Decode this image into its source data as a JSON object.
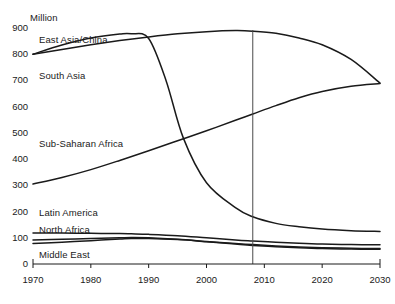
{
  "chart_data": {
    "type": "line",
    "title": "",
    "subtitle": "",
    "xlabel": "",
    "ylabel": "Million",
    "unit_label": "Million",
    "xlim": [
      1970,
      2030
    ],
    "ylim": [
      0,
      900
    ],
    "grid": false,
    "legend_position": "inline-labels",
    "x_ticks": [
      "1970",
      "1980",
      "1990",
      "2000",
      "2010",
      "2020",
      "2030"
    ],
    "y_ticks": [
      "0",
      "100",
      "200",
      "300",
      "400",
      "500",
      "600",
      "700",
      "800",
      "900"
    ],
    "annotations": [
      {
        "name": "reference-year-line",
        "type": "vertical-line",
        "x": 2008
      }
    ],
    "series": [
      {
        "name": "East Asia/China",
        "label": "East Asia/China",
        "color": "#1a1a1a",
        "x": [
          1970,
          1975,
          1980,
          1985,
          1987,
          1990,
          1993,
          1996,
          2000,
          2005,
          2008,
          2012,
          2016,
          2020,
          2025,
          2030
        ],
        "values": [
          800,
          835,
          862,
          877,
          878,
          860,
          700,
          480,
          310,
          215,
          180,
          155,
          142,
          133,
          127,
          124
        ]
      },
      {
        "name": "South Asia",
        "label": "South Asia",
        "color": "#1a1a1a",
        "x": [
          1970,
          1975,
          1980,
          1985,
          1990,
          1995,
          2000,
          2005,
          2008,
          2012,
          2016,
          2020,
          2025,
          2030
        ],
        "values": [
          800,
          818,
          836,
          852,
          866,
          878,
          886,
          890,
          888,
          880,
          862,
          836,
          780,
          690
        ]
      },
      {
        "name": "Sub-Saharan Africa",
        "label": "Sub-Saharan Africa",
        "color": "#1a1a1a",
        "x": [
          1970,
          1975,
          1980,
          1985,
          1990,
          1995,
          2000,
          2005,
          2008,
          2012,
          2016,
          2020,
          2025,
          2030
        ],
        "values": [
          305,
          330,
          360,
          395,
          432,
          470,
          508,
          548,
          572,
          604,
          634,
          658,
          678,
          688
        ]
      },
      {
        "name": "Latin America",
        "label": "Latin America",
        "color": "#1a1a1a",
        "x": [
          1970,
          1975,
          1980,
          1985,
          1987,
          1990,
          1995,
          2000,
          2005,
          2008,
          2012,
          2016,
          2020,
          2025,
          2030
        ],
        "values": [
          118,
          118,
          117,
          116,
          115,
          113,
          108,
          100,
          92,
          88,
          83,
          79,
          76,
          74,
          73
        ]
      },
      {
        "name": "North Africa",
        "label": "North Africa",
        "color": "#1a1a1a",
        "x": [
          1970,
          1975,
          1980,
          1985,
          1987,
          1990,
          1995,
          2000,
          2005,
          2008,
          2012,
          2016,
          2020,
          2025,
          2030
        ],
        "values": [
          92,
          94,
          97,
          100,
          101,
          100,
          94,
          85,
          76,
          71,
          66,
          62,
          59,
          57,
          56
        ]
      },
      {
        "name": "Middle East",
        "label": "Middle East",
        "color": "#1a1a1a",
        "x": [
          1970,
          1975,
          1980,
          1985,
          1987,
          1990,
          1995,
          2000,
          2005,
          2008,
          2012,
          2016,
          2020,
          2025,
          2030
        ],
        "values": [
          78,
          83,
          89,
          95,
          97,
          97,
          93,
          86,
          78,
          74,
          69,
          65,
          62,
          60,
          59
        ]
      }
    ]
  },
  "axis": {
    "unit": "Million"
  },
  "labels": {
    "east_asia": "East Asia/China",
    "south_asia": "South Asia",
    "sub_saharan_africa": "Sub-Saharan Africa",
    "latin_america": "Latin America",
    "north_africa": "North Africa",
    "middle_east": "Middle East"
  }
}
